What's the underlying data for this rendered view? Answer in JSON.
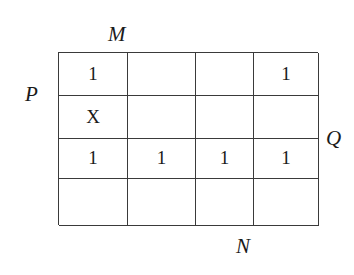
{
  "diagram": {
    "type": "karnaugh-map",
    "rows": 4,
    "columns": 4,
    "grid_color": "#3a3a3a",
    "background_color": "#ffffff",
    "text_color": "#1a1a1a"
  },
  "labels": {
    "top": "M",
    "left": "P",
    "right": "Q",
    "bottom": "N"
  },
  "cells": [
    [
      {
        "value": "1",
        "filled": true
      },
      {
        "value": "",
        "filled": false
      },
      {
        "value": "",
        "filled": false
      },
      {
        "value": "1",
        "filled": true
      }
    ],
    [
      {
        "value": "X",
        "filled": true
      },
      {
        "value": "",
        "filled": false
      },
      {
        "value": "",
        "filled": false
      },
      {
        "value": "",
        "filled": false
      }
    ],
    [
      {
        "value": "1",
        "filled": true
      },
      {
        "value": "1",
        "filled": true
      },
      {
        "value": "1",
        "filled": true
      },
      {
        "value": "1",
        "filled": true
      }
    ],
    [
      {
        "value": "",
        "filled": false
      },
      {
        "value": "",
        "filled": false
      },
      {
        "value": "",
        "filled": false
      },
      {
        "value": "",
        "filled": false
      }
    ]
  ]
}
